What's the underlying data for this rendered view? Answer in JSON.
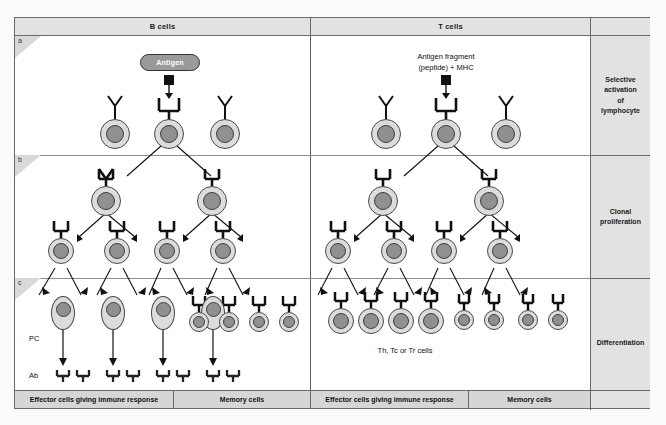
{
  "figure": {
    "columns": [
      {
        "id": "b-cells",
        "label": "B cells"
      },
      {
        "id": "t-cells",
        "label": "T cells"
      }
    ],
    "stage_labels": [
      {
        "letter": "a",
        "label": "Selective\nactivation\nof\nlymphocyte",
        "lines": [
          "Selective",
          "activation",
          "of",
          "lymphocyte"
        ]
      },
      {
        "letter": "b",
        "label": "Clonal\nproliferation",
        "lines": [
          "Clonal",
          "proliferation"
        ]
      },
      {
        "letter": "c",
        "label": "Differentiation",
        "lines": [
          "Differentiation"
        ]
      }
    ],
    "annotations": {
      "antigen_pill": "Antigen",
      "antigen_fragment_line1": "Antigen fragment",
      "antigen_fragment_line2": "(peptide) + MHC",
      "plasma_cell_abbr": "PC",
      "antibody_abbr": "Ab",
      "t_effector_caption": "Th, Tc or Tr cells"
    },
    "outcome_band": {
      "b_effector": "Effector cells giving immune response",
      "b_memory": "Memory cells",
      "t_effector": "Effector cells giving immune response",
      "t_memory": "Memory cells"
    },
    "counts": {
      "row_a_cells_per_column": 3,
      "row_b_level1_cells": 2,
      "row_b_level2_cells": 4,
      "row_c_b_plasma_cells": 4,
      "row_c_b_memory_cells": 4,
      "row_c_t_effector_cells": 4,
      "row_c_t_memory_cells": 4,
      "antibody_glyphs": 8
    },
    "colors": {
      "cell_cytoplasm": "#dcdcdc",
      "cell_nucleus": "#909090",
      "header_band": "#e2e2e2",
      "outcome_band": "#d6d6d6",
      "antigen_pill": "#9a9a9a",
      "frame_border": "#6a6a6a",
      "ink": "#111111"
    }
  }
}
